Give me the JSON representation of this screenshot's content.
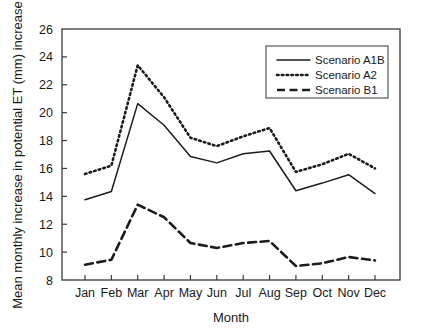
{
  "chart_data": {
    "type": "line",
    "title": "",
    "xlabel": "Month",
    "ylabel": "Mean monthly increase in potential ET (mm) increase",
    "categories": [
      "Jan",
      "Feb",
      "Mar",
      "Apr",
      "May",
      "Jun",
      "Jul",
      "Aug",
      "Sep",
      "Oct",
      "Nov",
      "Dec"
    ],
    "x_tick_labels": [
      "Jan",
      "Feb",
      "Mar",
      "Apr",
      "May",
      "Jun",
      "Jul",
      "Aug",
      "Sep",
      "Oct",
      "Nov",
      "Dec"
    ],
    "y_tick_labels": [
      "8",
      "10",
      "12",
      "14",
      "16",
      "18",
      "20",
      "22",
      "24",
      "26"
    ],
    "y_ticks": [
      8,
      10,
      12,
      14,
      16,
      18,
      20,
      22,
      24,
      26
    ],
    "ylim": [
      8,
      26
    ],
    "xlim_index": [
      0,
      11
    ],
    "grid": false,
    "legend_position": "top-right",
    "series": [
      {
        "name": "Scenario A1B",
        "style": "solid",
        "color": "#1c1c1c",
        "values": [
          13.75,
          14.35,
          20.65,
          19.1,
          16.85,
          16.4,
          17.05,
          17.25,
          14.4,
          14.95,
          15.55,
          14.2
        ]
      },
      {
        "name": "Scenario A2",
        "style": "dotted",
        "color": "#1c1c1c",
        "values": [
          15.6,
          16.2,
          23.4,
          21.1,
          18.2,
          17.6,
          18.3,
          18.9,
          15.75,
          16.3,
          17.05,
          16.0
        ]
      },
      {
        "name": "Scenario B1",
        "style": "dashed",
        "color": "#1c1c1c",
        "values": [
          9.1,
          9.45,
          13.4,
          12.5,
          10.65,
          10.3,
          10.65,
          10.8,
          9.0,
          9.2,
          9.65,
          9.4
        ]
      }
    ]
  },
  "legend": {
    "items": [
      {
        "label": "Scenario A1B",
        "style": "solid"
      },
      {
        "label": "Scenario A2",
        "style": "dotted"
      },
      {
        "label": "Scenario B1",
        "style": "dashed"
      }
    ]
  },
  "axes": {
    "x_axis_title": "Month",
    "y_axis_title": "Mean monthly increase in potential ET (mm) increase"
  }
}
